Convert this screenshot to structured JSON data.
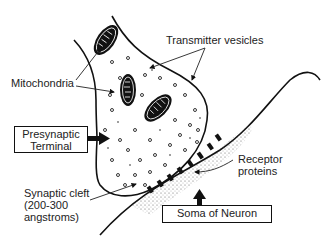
{
  "diagram": {
    "type": "synapse-anatomy",
    "labels": {
      "transmitter_vesicles": "Transmitter vesicles",
      "mitochondria": "Mitochondria",
      "presynaptic_terminal_line1": "Presynaptic",
      "presynaptic_terminal_line2": "Terminal",
      "synaptic_cleft_line1": "Synaptic cleft",
      "synaptic_cleft_line2": "(200-300",
      "synaptic_cleft_line3": "angstroms)",
      "receptor_line1": "Receptor",
      "receptor_line2": "proteins",
      "soma": "Soma of Neuron"
    },
    "colors": {
      "ink": "#111111",
      "text": "#222222",
      "background": "#ffffff"
    }
  }
}
